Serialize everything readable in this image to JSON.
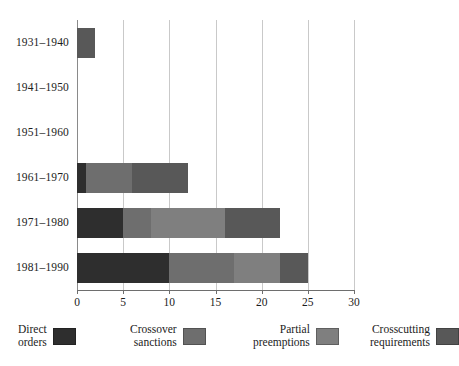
{
  "chart_data": {
    "type": "bar",
    "orientation": "horizontal",
    "stacked": true,
    "title": "",
    "subtitle": "",
    "xlabel": "",
    "ylabel": "",
    "xlim": [
      0,
      30
    ],
    "xticks": [
      0,
      5,
      10,
      15,
      20,
      25,
      30
    ],
    "xtick_labels": [
      "0",
      "5",
      "10",
      "15",
      "20",
      "25",
      "30"
    ],
    "grid": "vertical",
    "legend_position": "bottom",
    "categories": [
      "1931–1940",
      "1941–1950",
      "1951–1960",
      "1961–1970",
      "1971–1980",
      "1981–1990"
    ],
    "series": [
      {
        "name": "Direct orders",
        "color": "#2e2e2e",
        "values": [
          0,
          0,
          0,
          1,
          5,
          10
        ]
      },
      {
        "name": "Crossover sanctions",
        "color": "#6e6e6e",
        "values": [
          0,
          0,
          0,
          5,
          3,
          7
        ]
      },
      {
        "name": "Partial preemptions",
        "color": "#7f7f7f",
        "values": [
          0,
          0,
          0,
          0,
          8,
          5
        ]
      },
      {
        "name": "Crosscutting requirements",
        "color": "#585858",
        "values": [
          2,
          0,
          0,
          6,
          6,
          3
        ]
      }
    ],
    "totals": [
      2,
      0,
      0,
      12,
      22,
      25
    ]
  },
  "legend": {
    "items": [
      {
        "line1": "Direct",
        "line2": "orders",
        "swatch_name": "legend-swatch-direct-orders"
      },
      {
        "line1": "Crossover",
        "line2": "sanctions",
        "swatch_name": "legend-swatch-crossover-sanctions"
      },
      {
        "line1": "Partial",
        "line2": "preemptions",
        "swatch_name": "legend-swatch-partial-preemptions"
      },
      {
        "line1": "Crosscutting",
        "line2": "requirements",
        "swatch_name": "legend-swatch-crosscutting-requirements"
      }
    ]
  },
  "colors": {
    "direct_orders": "#2e2e2e",
    "crossover_sanctions": "#6e6e6e",
    "partial_preemptions": "#7f7f7f",
    "crosscutting_requirements": "#585858",
    "gridline": "#c9c9c9",
    "axis": "#6e6e6e",
    "background": "#ffffff",
    "text": "#1c1c1c"
  }
}
